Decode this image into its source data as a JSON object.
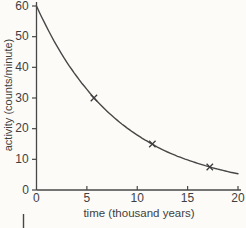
{
  "figure": {
    "background_color": "#fcfbf7",
    "ink_color": "#474747",
    "text_color": "#3f3f3f"
  },
  "chart_data": {
    "type": "line",
    "title": "",
    "xlabel": "time (thousand years)",
    "ylabel": "activity (counts/minute)",
    "xlim": [
      0,
      20
    ],
    "ylim": [
      0,
      60
    ],
    "x_ticks": [
      0,
      5,
      10,
      15,
      20
    ],
    "y_ticks": [
      0,
      10,
      20,
      30,
      40,
      50,
      60
    ],
    "grid": false,
    "legend": false,
    "series": [
      {
        "name": "activity decay curve",
        "x": [
          0,
          1,
          2,
          3,
          4,
          5,
          6,
          7,
          8,
          9,
          10,
          11,
          12,
          13,
          14,
          15,
          16,
          17,
          18,
          19,
          20
        ],
        "values": [
          60,
          53.2,
          47.1,
          41.7,
          37,
          32.8,
          29,
          25.7,
          22.8,
          20.2,
          17.9,
          15.9,
          14,
          12.4,
          11,
          9.8,
          8.7,
          7.7,
          6.8,
          6,
          5.3
        ]
      }
    ],
    "marked_points": [
      {
        "x": 5.7,
        "y": 30
      },
      {
        "x": 11.5,
        "y": 15
      },
      {
        "x": 17.2,
        "y": 7.5
      }
    ]
  }
}
